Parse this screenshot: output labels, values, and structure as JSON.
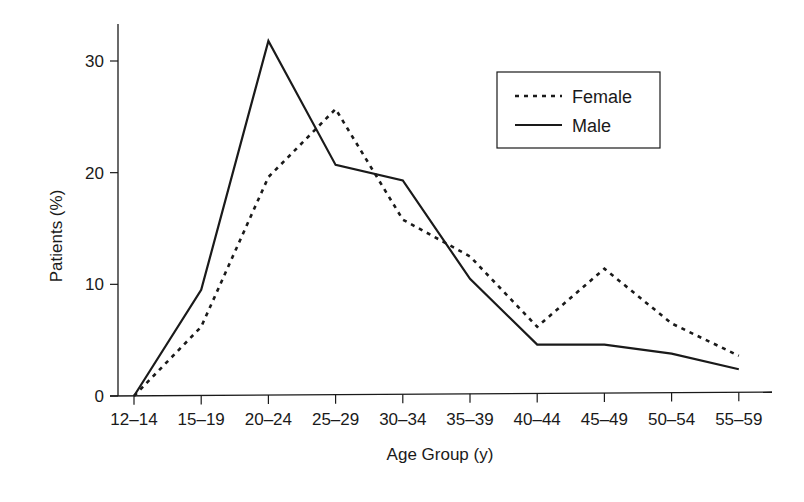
{
  "chart_data": {
    "type": "line",
    "title": "",
    "xlabel": "Age Group (y)",
    "ylabel": "Patients (%)",
    "categories": [
      "12–14",
      "15–19",
      "20–24",
      "25–29",
      "30–34",
      "35–39",
      "40–44",
      "45–49",
      "50–54",
      "55–59"
    ],
    "yticks": [
      0,
      10,
      20,
      30
    ],
    "ylim": [
      0,
      33
    ],
    "grid": false,
    "legend_position": "upper right",
    "series": [
      {
        "name": "Female",
        "style": "dashed",
        "color": "#1a1a1a",
        "values": [
          0,
          6.2,
          19.6,
          25.7,
          15.8,
          12.5,
          6.2,
          11.4,
          6.5,
          3.6
        ]
      },
      {
        "name": "Male",
        "style": "solid",
        "color": "#1a1a1a",
        "values": [
          0,
          9.5,
          31.8,
          20.7,
          19.3,
          10.5,
          4.6,
          4.6,
          3.8,
          2.4
        ]
      }
    ]
  },
  "legend": {
    "items": [
      {
        "label": "Female",
        "style": "dashed"
      },
      {
        "label": "Male",
        "style": "solid"
      }
    ]
  }
}
